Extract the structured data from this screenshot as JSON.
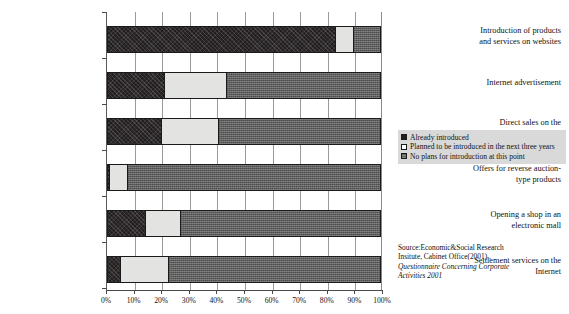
{
  "chart_data": {
    "type": "bar",
    "orientation": "horizontal",
    "stacked": true,
    "title": "",
    "xlabel": "",
    "ylabel": "",
    "xlim": [
      0,
      100
    ],
    "xticks": [
      "0%",
      "10%",
      "20%",
      "30%",
      "40%",
      "50%",
      "60%",
      "70%",
      "80%",
      "90%",
      "100%"
    ],
    "grid": "vertical",
    "legend_position": "right",
    "categories": [
      "Introduction of products and services on websites",
      "Internet advertisement",
      "Direct sales on the Internet",
      "Offers for reverse auction-type products",
      "Opening a shop in an electronic mall",
      "Settlement services on the Internet"
    ],
    "series": [
      {
        "name": "Already introduced",
        "color": "#231f20",
        "values": [
          83,
          21,
          20,
          1,
          14,
          5
        ]
      },
      {
        "name": "Planned to be introduced in the next three years",
        "color": "#e3e3e1",
        "values": [
          7,
          23,
          21,
          7,
          13,
          18
        ]
      },
      {
        "name": "No plans for introduction at this point",
        "color": "#5f5f5f",
        "values": [
          10,
          56,
          59,
          92,
          73,
          77
        ]
      }
    ]
  },
  "categories_display": [
    {
      "line1": "Introduction of products",
      "line2": "and services on websites"
    },
    {
      "line1": "Internet advertisement",
      "line2": ""
    },
    {
      "line1": "Direct sales on the",
      "line2": "Internet"
    },
    {
      "line1": "Offers for reverse auction-",
      "line2": "type products"
    },
    {
      "line1": "Opening a shop in an",
      "line2": "electronic mall"
    },
    {
      "line1": "Settlement services on the",
      "line2": "Internet"
    }
  ],
  "legend": {
    "items": [
      {
        "label": "Already introduced"
      },
      {
        "label": "Planned to be introduced in the next three years"
      },
      {
        "label": "No plans for introduction at this point"
      }
    ]
  },
  "source": {
    "line1": "Source:Economic&Social Research",
    "line2": "Insitute, Cabinet Office(2001) ,",
    "line3": "Questionnaire Concerning Corporate",
    "line4": "Activities 2001"
  },
  "xticks": [
    {
      "label": "0%"
    },
    {
      "label": "10%"
    },
    {
      "label": "20%"
    },
    {
      "label": "30%"
    },
    {
      "label": "40%"
    },
    {
      "label": "50%"
    },
    {
      "label": "60%"
    },
    {
      "label": "70%"
    },
    {
      "label": "80%"
    },
    {
      "label": "90%"
    },
    {
      "label": "100%"
    }
  ]
}
